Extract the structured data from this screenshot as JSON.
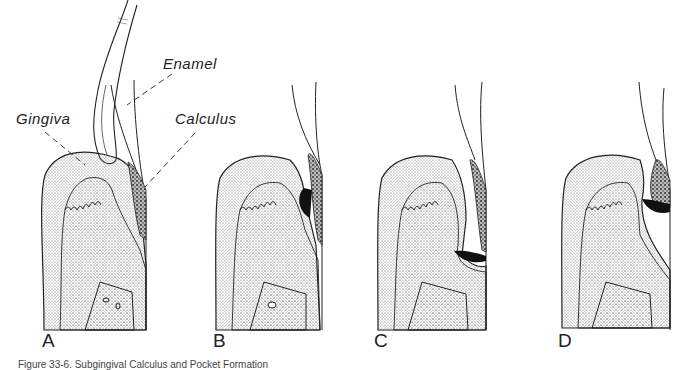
{
  "figure": {
    "labels": {
      "enamel": "Enamel",
      "gingiva": "Gingiva",
      "calculus": "Calculus"
    },
    "panels": [
      {
        "letter": "A"
      },
      {
        "letter": "B"
      },
      {
        "letter": "C"
      },
      {
        "letter": "D"
      }
    ],
    "caption": "Figure 33-6. Subgingival Calculus and Pocket Formation"
  }
}
